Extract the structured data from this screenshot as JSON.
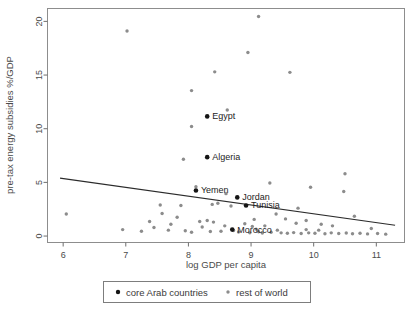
{
  "chart_data": {
    "type": "scatter",
    "title": "",
    "xlabel": "log GDP per capita",
    "ylabel": "pre-tax energy subsidies %/GDP",
    "xlim": [
      5.75,
      11.45
    ],
    "ylim": [
      -0.6,
      21.2
    ],
    "xticks": [
      6,
      7,
      8,
      9,
      10,
      11
    ],
    "yticks": [
      0,
      5,
      10,
      15,
      20
    ],
    "grid": false,
    "legend_position": "below-axis",
    "series": [
      {
        "name": "core Arab countries",
        "marker": "filled-circle-dark",
        "color": "#151515",
        "points": [
          {
            "label": "Egypt",
            "x": 8.3,
            "y": 11.15,
            "label_dx": 5,
            "label_dy": 3
          },
          {
            "label": "Algeria",
            "x": 8.3,
            "y": 7.35,
            "label_dx": 5,
            "label_dy": 3
          },
          {
            "label": "Yemen",
            "x": 8.12,
            "y": 4.25,
            "label_dx": 5,
            "label_dy": 3
          },
          {
            "label": "Jordan",
            "x": 8.78,
            "y": 3.6,
            "label_dx": 5,
            "label_dy": 3
          },
          {
            "label": "Tunisia",
            "x": 8.92,
            "y": 2.85,
            "label_dx": 5,
            "label_dy": 3
          },
          {
            "label": "Morocco",
            "x": 8.7,
            "y": 0.6,
            "label_dx": 5,
            "label_dy": 3
          }
        ]
      },
      {
        "name": "rest of world",
        "marker": "small-circle-grey",
        "color": "#8c8c8c",
        "points": [
          {
            "x": 7.02,
            "y": 19.1
          },
          {
            "x": 9.12,
            "y": 20.45
          },
          {
            "x": 8.95,
            "y": 17.1
          },
          {
            "x": 8.42,
            "y": 15.3
          },
          {
            "x": 9.62,
            "y": 15.25
          },
          {
            "x": 8.05,
            "y": 13.55
          },
          {
            "x": 8.62,
            "y": 11.75
          },
          {
            "x": 8.05,
            "y": 10.2
          },
          {
            "x": 7.92,
            "y": 7.15
          },
          {
            "x": 10.5,
            "y": 5.8
          },
          {
            "x": 10.48,
            "y": 4.15
          },
          {
            "x": 9.95,
            "y": 4.55
          },
          {
            "x": 9.3,
            "y": 4.95
          },
          {
            "x": 6.05,
            "y": 2.05
          },
          {
            "x": 7.55,
            "y": 2.9
          },
          {
            "x": 7.38,
            "y": 1.35
          },
          {
            "x": 7.58,
            "y": 2.1
          },
          {
            "x": 7.88,
            "y": 2.85
          },
          {
            "x": 7.82,
            "y": 1.75
          },
          {
            "x": 8.18,
            "y": 1.35
          },
          {
            "x": 8.3,
            "y": 1.45
          },
          {
            "x": 8.22,
            "y": 0.85
          },
          {
            "x": 8.38,
            "y": 2.95
          },
          {
            "x": 8.47,
            "y": 3.05
          },
          {
            "x": 8.4,
            "y": 1.3
          },
          {
            "x": 8.68,
            "y": 2.8
          },
          {
            "x": 8.6,
            "y": 3.95
          },
          {
            "x": 8.12,
            "y": 4.6
          },
          {
            "x": 8.9,
            "y": 1.15
          },
          {
            "x": 9.05,
            "y": 1.55
          },
          {
            "x": 9.08,
            "y": 0.65
          },
          {
            "x": 9.12,
            "y": 0.4
          },
          {
            "x": 9.42,
            "y": 0.55
          },
          {
            "x": 9.75,
            "y": 2.6
          },
          {
            "x": 9.4,
            "y": 2.05
          },
          {
            "x": 9.55,
            "y": 1.6
          },
          {
            "x": 9.88,
            "y": 1.45
          },
          {
            "x": 9.72,
            "y": 1.2
          },
          {
            "x": 10.12,
            "y": 1.1
          },
          {
            "x": 10.3,
            "y": 0.95
          },
          {
            "x": 10.65,
            "y": 1.85
          },
          {
            "x": 10.92,
            "y": 0.7
          },
          {
            "x": 6.95,
            "y": 0.6
          },
          {
            "x": 7.25,
            "y": 0.45
          },
          {
            "x": 7.68,
            "y": 0.55
          },
          {
            "x": 7.95,
            "y": 0.5
          },
          {
            "x": 8.05,
            "y": 0.35
          },
          {
            "x": 8.52,
            "y": 0.45
          },
          {
            "x": 8.8,
            "y": 0.38
          },
          {
            "x": 8.98,
            "y": 0.3
          },
          {
            "x": 9.18,
            "y": 0.28
          },
          {
            "x": 9.32,
            "y": 0.35
          },
          {
            "x": 9.48,
            "y": 0.3
          },
          {
            "x": 9.58,
            "y": 0.26
          },
          {
            "x": 9.68,
            "y": 0.32
          },
          {
            "x": 9.8,
            "y": 0.24
          },
          {
            "x": 9.92,
            "y": 0.3
          },
          {
            "x": 10.02,
            "y": 0.26
          },
          {
            "x": 10.18,
            "y": 0.22
          },
          {
            "x": 10.28,
            "y": 0.3
          },
          {
            "x": 10.4,
            "y": 0.24
          },
          {
            "x": 10.52,
            "y": 0.28
          },
          {
            "x": 10.62,
            "y": 0.22
          },
          {
            "x": 10.74,
            "y": 0.26
          },
          {
            "x": 10.86,
            "y": 0.2
          },
          {
            "x": 11.02,
            "y": 0.24
          },
          {
            "x": 11.15,
            "y": 0.18
          },
          {
            "x": 8.72,
            "y": 0.52
          },
          {
            "x": 9.02,
            "y": 0.9
          },
          {
            "x": 9.22,
            "y": 0.95
          },
          {
            "x": 8.35,
            "y": 0.42
          },
          {
            "x": 7.72,
            "y": 1.1
          },
          {
            "x": 7.45,
            "y": 0.8
          },
          {
            "x": 8.58,
            "y": 0.95
          },
          {
            "x": 9.88,
            "y": 0.6
          },
          {
            "x": 10.08,
            "y": 0.55
          }
        ]
      }
    ],
    "fit_line": {
      "x0": 5.95,
      "y0": 5.4,
      "x1": 11.3,
      "y1": 1.0
    }
  },
  "legend": {
    "entries": [
      {
        "label": "core Arab countries",
        "marker_color": "#151515"
      },
      {
        "label": "rest of world",
        "marker_color": "#8c8c8c"
      }
    ]
  }
}
